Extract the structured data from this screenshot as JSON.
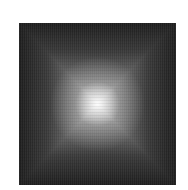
{
  "image": {
    "description": "Grayscale square with bright center fading to dark edges in a pyramidal pattern",
    "colors": {
      "background": "#ffffff",
      "edge": "#1e1e1e",
      "center": "#f5f5f5"
    }
  }
}
